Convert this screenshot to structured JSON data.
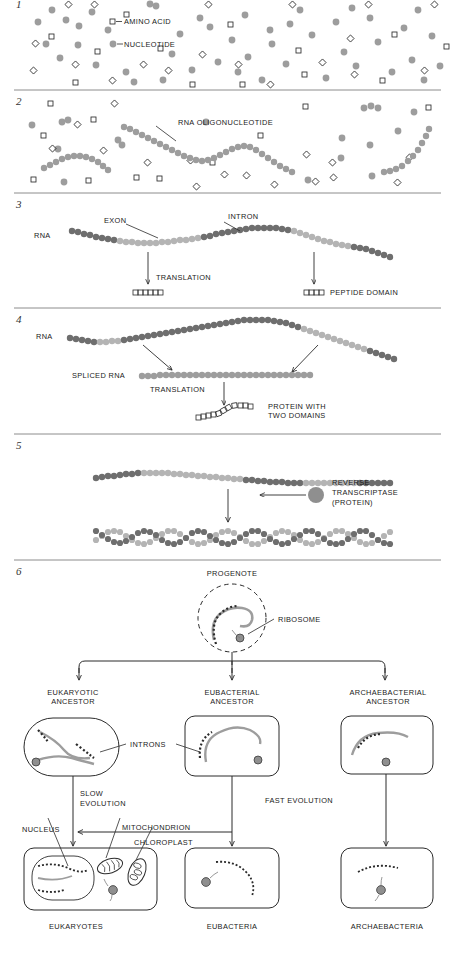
{
  "figure": {
    "panels": [
      {
        "number": "1",
        "labels": [
          "AMINO ACID",
          "NUCLEOTIDE"
        ]
      },
      {
        "number": "2",
        "labels": [
          "RNA OLIGONUCLEOTIDE"
        ]
      },
      {
        "number": "3",
        "labels": [
          "RNA",
          "EXON",
          "INTRON",
          "TRANSLATION",
          "PEPTIDE DOMAIN"
        ]
      },
      {
        "number": "4",
        "labels": [
          "RNA",
          "SPLICED RNA",
          "TRANSLATION",
          "PROTEIN WITH",
          "TWO DOMAINS"
        ]
      },
      {
        "number": "5",
        "labels": [
          "REVERSE",
          "TRANSCRIPTASE",
          "(PROTEIN)"
        ]
      },
      {
        "number": "6",
        "labels": [
          "PROGENOTE",
          "RIBOSOME",
          "EUKARYOTIC",
          "ANCESTOR",
          "EUBACTERIAL",
          "ARCHAEBACTERIAL",
          "INTRONS",
          "SLOW",
          "EVOLUTION",
          "FAST EVOLUTION",
          "NUCLEUS",
          "MITOCHONDRION",
          "CHLOROPLAST",
          "EUKARYOTES",
          "EUBACTERIA",
          "ARCHAEBACTERIA"
        ]
      }
    ]
  },
  "panel1": {
    "number": "1",
    "legend_amino_acid": "AMINO ACID",
    "legend_nucleotide": "NUCLEOTIDE"
  },
  "panel2": {
    "number": "2",
    "rna_oligonucleotide": "RNA OLIGONUCLEOTIDE"
  },
  "panel3": {
    "number": "3",
    "rna": "RNA",
    "exon": "EXON",
    "intron": "INTRON",
    "translation": "TRANSLATION",
    "peptide_domain": "PEPTIDE DOMAIN"
  },
  "panel4": {
    "number": "4",
    "rna": "RNA",
    "spliced_rna": "SPLICED RNA",
    "translation": "TRANSLATION",
    "protein_line1": "PROTEIN WITH",
    "protein_line2": "TWO DOMAINS"
  },
  "panel5": {
    "number": "5",
    "enzyme_line1": "REVERSE",
    "enzyme_line2": "TRANSCRIPTASE",
    "enzyme_line3": "(PROTEIN)"
  },
  "panel6": {
    "number": "6",
    "progenote": "PROGENOTE",
    "ribosome": "RIBOSOME",
    "ancestor_eukaryotic_line1": "EUKARYOTIC",
    "ancestor_eukaryotic_line2": "ANCESTOR",
    "ancestor_eubacterial_line1": "EUBACTERIAL",
    "ancestor_eubacterial_line2": "ANCESTOR",
    "ancestor_archaebacterial_line1": "ARCHAEBACTERIAL",
    "ancestor_archaebacterial_line2": "ANCESTOR",
    "introns": "INTRONS",
    "slow_line1": "SLOW",
    "slow_line2": "EVOLUTION",
    "fast": "FAST EVOLUTION",
    "nucleus": "NUCLEUS",
    "mitochondrion": "MITOCHONDRION",
    "chloroplast": "CHLOROPLAST",
    "eukaryotes": "EUKARYOTES",
    "eubacteria": "EUBACTERIA",
    "archaebacteria": "ARCHAEBACTERIA"
  },
  "colors": {
    "nucleotide_gray": "#9d9d9d",
    "exon_dark": "#6e6e6e",
    "intron_light": "#b4b4b4",
    "outline": "#2b2b2b",
    "rule": "#8c8c8c",
    "text": "#1a1a1a",
    "background": "#ffffff"
  }
}
